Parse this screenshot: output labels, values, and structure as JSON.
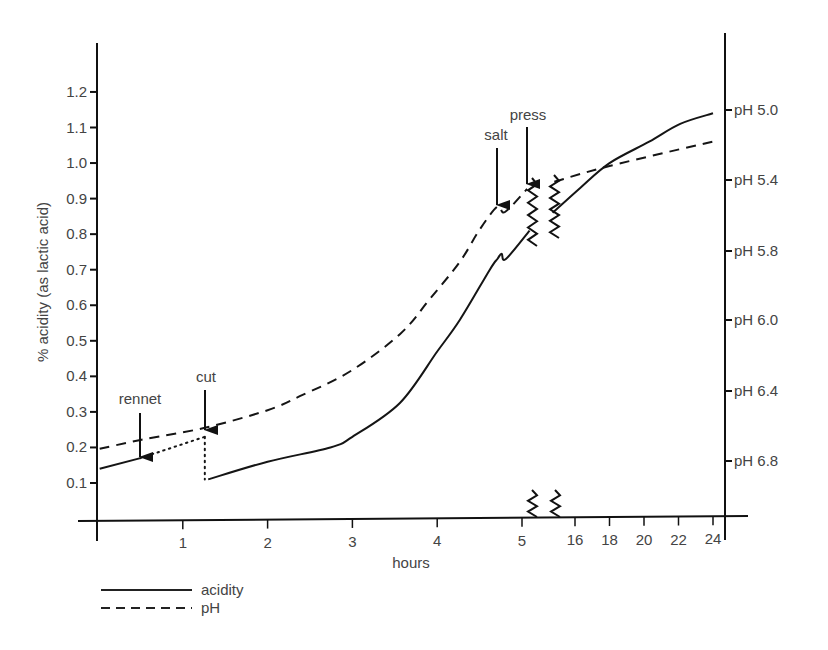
{
  "chart_data": {
    "type": "line",
    "title": "",
    "xlabel": "hours",
    "ylabel": "% acidity (as lactic acid)",
    "y2label": "pH",
    "x_axis": {
      "segments": [
        {
          "range": [
            0,
            5
          ],
          "ticks": [
            1,
            2,
            3,
            4,
            5
          ],
          "tick_labels": [
            "1",
            "2",
            "3",
            "4",
            "5"
          ]
        },
        {
          "range": [
            16,
            24
          ],
          "ticks": [
            16,
            18,
            20,
            22,
            24
          ],
          "tick_labels": [
            "16",
            "18",
            "20",
            "22",
            "24"
          ]
        }
      ],
      "break_between": [
        5,
        16
      ]
    },
    "y_axis": {
      "ylim": [
        0,
        1.3
      ],
      "ticks": [
        0.1,
        0.2,
        0.3,
        0.4,
        0.5,
        0.6,
        0.7,
        0.8,
        0.9,
        1.0,
        1.1,
        1.2
      ],
      "tick_labels": [
        "0.1",
        "0.2",
        "0.3",
        "0.4",
        "0.5",
        "0.6",
        "0.7",
        "0.8",
        "0.9",
        "1.0",
        "1.1",
        "1.2"
      ]
    },
    "y2_axis": {
      "ticks": [
        5.0,
        5.4,
        5.8,
        6.0,
        6.4,
        6.8
      ],
      "tick_labels": [
        "pH 5.0",
        "pH 5.4",
        "pH 5.8",
        "pH 6.0",
        "pH 6.4",
        "pH 6.8"
      ],
      "tick_positions_on_acidity_scale": [
        1.135,
        0.938,
        0.738,
        0.544,
        0.344,
        0.147
      ]
    },
    "grid": false,
    "legend": {
      "position": "bottom-left",
      "entries": [
        {
          "label": "acidity",
          "style": "solid"
        },
        {
          "label": "pH",
          "style": "dashed"
        }
      ]
    },
    "series": [
      {
        "name": "acidity",
        "axis": "left",
        "style": "solid",
        "segments": [
          {
            "style": "solid",
            "x": [
              0.02,
              0.5
            ],
            "y": [
              0.14,
              0.17
            ]
          },
          {
            "style": "dotted",
            "x": [
              0.5,
              1.26
            ],
            "y": [
              0.17,
              0.23
            ]
          },
          {
            "style": "dotted",
            "x": [
              1.26,
              1.26
            ],
            "y": [
              0.23,
              0.11
            ]
          },
          {
            "style": "solid",
            "x": [
              1.3,
              2.0,
              2.74,
              3.0,
              3.56,
              4.0,
              4.27,
              4.62,
              4.71,
              4.76,
              4.81,
              5.09
            ],
            "y": [
              0.11,
              0.16,
              0.2,
              0.23,
              0.325,
              0.47,
              0.56,
              0.7,
              0.73,
              0.745,
              0.73,
              0.81
            ]
          },
          {
            "style": "solid",
            "x": [
              14.7,
              16.3,
              18.0,
              20.3,
              22.1,
              24.0
            ],
            "y": [
              0.86,
              0.93,
              1.0,
              1.06,
              1.11,
              1.14
            ]
          }
        ]
      },
      {
        "name": "pH",
        "axis": "right",
        "style": "dashed",
        "segments": [
          {
            "style": "dashed",
            "x": [
              0.02,
              0.5,
              1.26,
              2.0,
              2.38,
              2.97,
              3.56,
              3.91,
              4.27,
              4.5,
              4.71,
              4.8,
              5.06
            ],
            "y": [
              6.73,
              6.68,
              6.61,
              6.51,
              6.43,
              6.29,
              6.08,
              5.94,
              5.83,
              5.68,
              5.55,
              5.58,
              5.45
            ]
          },
          {
            "style": "dashed",
            "x": [
              14.8,
              18.0,
              24.0
            ],
            "y": [
              5.41,
              5.32,
              5.18
            ]
          }
        ]
      }
    ],
    "annotations": [
      {
        "label": "rennet",
        "x": 0.5,
        "type": "arrow-down"
      },
      {
        "label": "cut",
        "x": 1.26,
        "type": "arrow-down"
      },
      {
        "label": "salt",
        "x": 4.71,
        "type": "arrow-down"
      },
      {
        "label": "press",
        "x": 5.05,
        "type": "arrow-down"
      }
    ]
  },
  "layout": {
    "left_axis_x": 97,
    "right_axis_x": 725,
    "x_axis_y": 520,
    "plot_top_left": 43,
    "plot_top_right": 33,
    "seg1_px": [
      98,
      522
    ],
    "seg2_px": [
      575,
      713
    ],
    "acid_px": {
      "a0": 0.1,
      "y0": 483,
      "per_unit": 355.5
    },
    "ph_px": {
      "ph": [
        5.0,
        5.4,
        5.8,
        6.0,
        6.4,
        6.8
      ],
      "y": [
        110,
        180,
        251,
        320,
        391,
        461
      ]
    },
    "break_x": [
      532,
      555
    ]
  },
  "texts": {
    "xlabel": "hours",
    "ylabel": "% acidity (as lactic acid)",
    "legend_acidity": "acidity",
    "legend_ph": "pH",
    "annot_rennet": "rennet",
    "annot_cut": "cut",
    "annot_salt": "salt",
    "annot_press": "press"
  }
}
